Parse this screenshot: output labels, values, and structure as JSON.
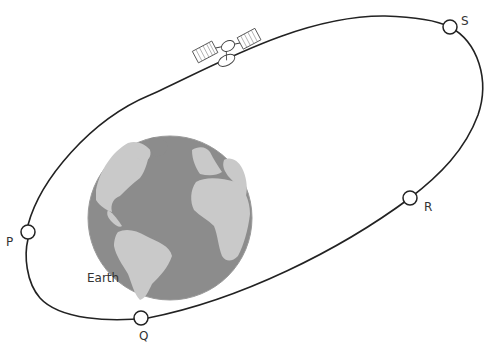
{
  "diagram": {
    "earth_label": "Earth",
    "points": [
      {
        "id": "P",
        "label": "P"
      },
      {
        "id": "Q",
        "label": "Q"
      },
      {
        "id": "R",
        "label": "R"
      },
      {
        "id": "S",
        "label": "S"
      }
    ],
    "colors": {
      "orbit": "#222222",
      "ocean": "#8a8a8a",
      "land": "#c8c8c8",
      "background": "#ffffff"
    }
  }
}
